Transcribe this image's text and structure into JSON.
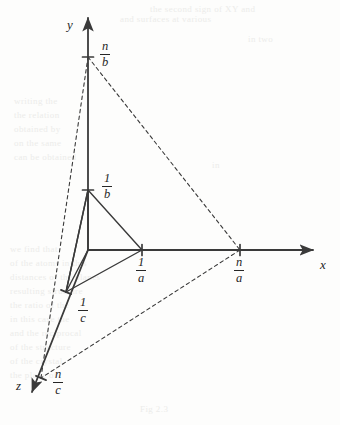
{
  "figure": {
    "kind": "crystallographic-axes-diagram",
    "background_color": "#fdfdfc",
    "stroke_color": "#3a3a3a",
    "text_color": "#262626"
  },
  "axes": [
    {
      "id": "y",
      "label": "y",
      "label_x": 67,
      "label_y": 18,
      "direction": "up"
    },
    {
      "id": "x",
      "label": "x",
      "label_x": 320,
      "label_y": 258,
      "direction": "right"
    },
    {
      "id": "z",
      "label": "z",
      "label_x": 16,
      "label_y": 379,
      "direction": "down-left"
    }
  ],
  "intercepts": [
    {
      "id": "n-over-b",
      "numerator": "n",
      "denominator": "b",
      "axis": "y",
      "point_x": 88,
      "point_y": 57,
      "label_x": 100,
      "label_y": 40
    },
    {
      "id": "one-over-b",
      "numerator": "1",
      "denominator": "b",
      "axis": "y",
      "point_x": 88,
      "point_y": 190,
      "label_x": 102,
      "label_y": 172
    },
    {
      "id": "one-over-a",
      "numerator": "1",
      "denominator": "a",
      "axis": "x",
      "point_x": 142,
      "point_y": 250,
      "label_x": 136,
      "label_y": 256
    },
    {
      "id": "n-over-a",
      "numerator": "n",
      "denominator": "a",
      "axis": "x",
      "point_x": 240,
      "point_y": 250,
      "label_x": 234,
      "label_y": 256
    },
    {
      "id": "one-over-c",
      "numerator": "1",
      "denominator": "c",
      "axis": "z",
      "point_x": 66,
      "point_y": 292,
      "label_x": 78,
      "label_y": 296
    },
    {
      "id": "n-over-c",
      "numerator": "n",
      "denominator": "c",
      "axis": "z",
      "point_x": 41,
      "point_y": 378,
      "label_x": 53,
      "label_y": 368
    }
  ],
  "geometry": {
    "origin": {
      "x": 88,
      "y": 250
    },
    "y_axis_tip": {
      "x": 88,
      "y": 18
    },
    "x_axis_tip": {
      "x": 313,
      "y": 250
    },
    "z_axis_tip": {
      "x": 32,
      "y": 392
    },
    "solid_triangle": [
      {
        "x": 88,
        "y": 190
      },
      {
        "x": 142,
        "y": 250
      },
      {
        "x": 66,
        "y": 292
      }
    ],
    "solid_helper_edges": [
      [
        {
          "x": 88,
          "y": 190
        },
        {
          "x": 88,
          "y": 250
        }
      ],
      [
        {
          "x": 88,
          "y": 190
        },
        {
          "x": 66,
          "y": 292
        }
      ],
      [
        {
          "x": 88,
          "y": 250
        },
        {
          "x": 66,
          "y": 292
        }
      ]
    ],
    "dashed_triangle": [
      {
        "x": 88,
        "y": 57
      },
      {
        "x": 240,
        "y": 250
      },
      {
        "x": 41,
        "y": 378
      }
    ]
  },
  "ghost_text": {
    "description": "faint show-through text from the reverse side of the printed page",
    "lines": [
      {
        "text": "the second sign of XY and",
        "x": 150,
        "y": 4
      },
      {
        "text": "and surfaces at various",
        "x": 120,
        "y": 14
      },
      {
        "text": "in two",
        "x": 248,
        "y": 34
      },
      {
        "text": "writing the",
        "x": 14,
        "y": 96
      },
      {
        "text": "the relation",
        "x": 14,
        "y": 110
      },
      {
        "text": "obtained by",
        "x": 14,
        "y": 124
      },
      {
        "text": "on the same",
        "x": 14,
        "y": 138
      },
      {
        "text": "can be obtained",
        "x": 14,
        "y": 152
      },
      {
        "text": "in",
        "x": 212,
        "y": 160
      },
      {
        "text": "we find that",
        "x": 10,
        "y": 244
      },
      {
        "text": "of the atoms in this",
        "x": 10,
        "y": 258
      },
      {
        "text": "distances of the planes",
        "x": 10,
        "y": 272
      },
      {
        "text": "resulting structure",
        "x": 10,
        "y": 286
      },
      {
        "text": "the ratio of the",
        "x": 10,
        "y": 300
      },
      {
        "text": "in this case the",
        "x": 10,
        "y": 314
      },
      {
        "text": "and the reciprocal",
        "x": 10,
        "y": 328
      },
      {
        "text": "of the structure",
        "x": 10,
        "y": 342
      },
      {
        "text": "of the crystal",
        "x": 10,
        "y": 356
      },
      {
        "text": "the plane of",
        "x": 10,
        "y": 370
      },
      {
        "text": "Fig 2.3",
        "x": 140,
        "y": 404
      }
    ]
  }
}
